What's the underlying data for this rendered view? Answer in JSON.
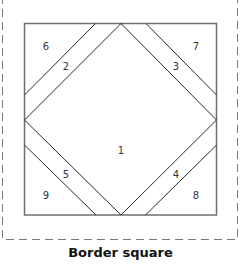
{
  "title": "Border square",
  "colors": {
    "outline": "#6e6e6e",
    "lines": "#2b2b2b",
    "dashed_border": "#7a7a7a",
    "label": "#333333",
    "background": "#ffffff"
  },
  "labels": [
    {
      "id": "1",
      "text": "1",
      "x": 121,
      "y": 154
    },
    {
      "id": "2",
      "text": "2",
      "x": 66,
      "y": 70
    },
    {
      "id": "3",
      "text": "3",
      "x": 176,
      "y": 70
    },
    {
      "id": "4",
      "text": "4",
      "x": 176,
      "y": 178
    },
    {
      "id": "5",
      "text": "5",
      "x": 66,
      "y": 178
    },
    {
      "id": "6",
      "text": "6",
      "x": 46,
      "y": 50
    },
    {
      "id": "7",
      "text": "7",
      "x": 196,
      "y": 50
    },
    {
      "id": "8",
      "text": "8",
      "x": 196,
      "y": 199
    },
    {
      "id": "9",
      "text": "9",
      "x": 46,
      "y": 199
    }
  ]
}
